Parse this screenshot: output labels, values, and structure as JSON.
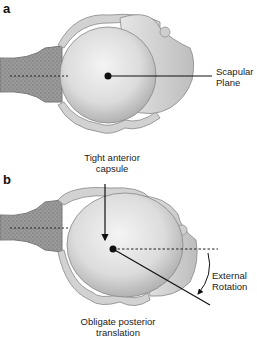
{
  "panels": [
    {
      "id": "a",
      "label": "a",
      "annotations": {
        "scapular_plane": [
          "Scapular",
          "Plane"
        ]
      }
    },
    {
      "id": "b",
      "label": "b",
      "annotations": {
        "tight_anterior_capsule": [
          "Tight anterior",
          "capsule"
        ],
        "external_rotation": [
          "External",
          "Rotation"
        ],
        "obligate_posterior_translation": [
          "Obligate posterior",
          "translation"
        ]
      }
    }
  ],
  "colors": {
    "background": "#ffffff",
    "humeral_head": "#d9d9d9",
    "capsule": "#cfcfcf",
    "glenoid": "#8a8a8a",
    "line": "#111111"
  }
}
